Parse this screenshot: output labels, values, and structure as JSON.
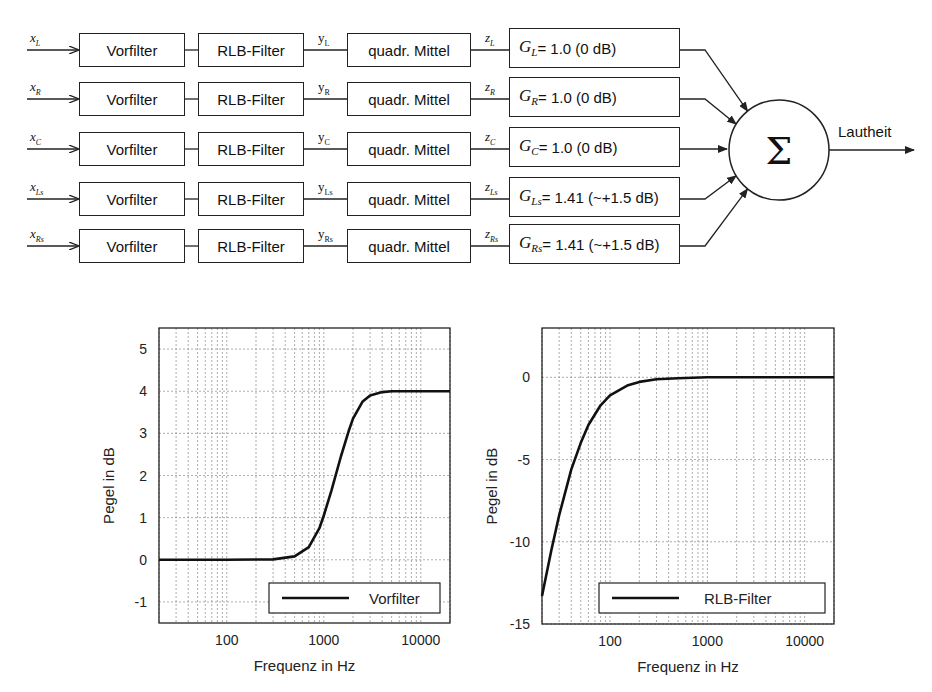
{
  "diagram": {
    "channels": [
      {
        "input": "x",
        "input_sub": "L",
        "prefilter": "Vorfilter",
        "rlb": "RLB-Filter",
        "y": "y",
        "y_sub": "L",
        "ms": "quadr. Mittel",
        "z": "z",
        "z_sub": "L",
        "gain_sym": "G",
        "gain_sub": "L",
        "gain_text": "= 1.0 (0 dB)"
      },
      {
        "input": "x",
        "input_sub": "R",
        "prefilter": "Vorfilter",
        "rlb": "RLB-Filter",
        "y": "y",
        "y_sub": "R",
        "ms": "quadr. Mittel",
        "z": "z",
        "z_sub": "R",
        "gain_sym": "G",
        "gain_sub": "R",
        "gain_text": "= 1.0 (0 dB)"
      },
      {
        "input": "x",
        "input_sub": "C",
        "prefilter": "Vorfilter",
        "rlb": "RLB-Filter",
        "y": "y",
        "y_sub": "C",
        "ms": "quadr. Mittel",
        "z": "z",
        "z_sub": "C",
        "gain_sym": "G",
        "gain_sub": "C",
        "gain_text": "= 1.0 (0 dB)"
      },
      {
        "input": "x",
        "input_sub": "Ls",
        "prefilter": "Vorfilter",
        "rlb": "RLB-Filter",
        "y": "y",
        "y_sub": "Ls",
        "ms": "quadr. Mittel",
        "z": "z",
        "z_sub": "Ls",
        "gain_sym": "G",
        "gain_sub": "Ls",
        "gain_text": "= 1.41 (~+1.5 dB)"
      },
      {
        "input": "x",
        "input_sub": "Rs",
        "prefilter": "Vorfilter",
        "rlb": "RLB-Filter",
        "y": "y",
        "y_sub": "Rs",
        "ms": "quadr. Mittel",
        "z": "z",
        "z_sub": "Rs",
        "gain_sym": "G",
        "gain_sub": "Rs",
        "gain_text": "= 1.41 (~+1.5 dB)"
      }
    ],
    "sum_symbol": "Σ",
    "output_label": "Lautheit"
  },
  "chart_data": [
    {
      "type": "line",
      "title": "",
      "xlabel": "Frequenz in Hz",
      "ylabel": "Pegel in dB",
      "xscale": "log",
      "xlim": [
        20,
        20000
      ],
      "ylim": [
        -1.5,
        5.5
      ],
      "xticks": [
        100,
        1000,
        10000
      ],
      "xtick_labels": [
        "100",
        "1000",
        "10000"
      ],
      "yticks": [
        -1,
        0,
        1,
        2,
        3,
        4,
        5
      ],
      "ytick_labels": [
        "-1",
        "0",
        "1",
        "2",
        "3",
        "4",
        "5"
      ],
      "grid": true,
      "legend_position": "lower right",
      "series": [
        {
          "name": "Vorfilter",
          "x": [
            20,
            100,
            300,
            500,
            700,
            900,
            1000,
            1200,
            1500,
            1800,
            2000,
            2500,
            3000,
            4000,
            5000,
            10000,
            20000
          ],
          "y": [
            0,
            0,
            0.01,
            0.08,
            0.3,
            0.75,
            1.05,
            1.65,
            2.45,
            3.05,
            3.35,
            3.75,
            3.9,
            3.98,
            4.0,
            4.0,
            4.0
          ]
        }
      ]
    },
    {
      "type": "line",
      "title": "",
      "xlabel": "Frequenz in Hz",
      "ylabel": "Pegel in dB",
      "xscale": "log",
      "xlim": [
        20,
        20000
      ],
      "ylim": [
        -15,
        3
      ],
      "xticks": [
        100,
        1000,
        10000
      ],
      "xtick_labels": [
        "100",
        "1000",
        "10000"
      ],
      "yticks": [
        -15,
        -10,
        -5,
        0
      ],
      "ytick_labels": [
        "-15",
        "-10",
        "-5",
        "0"
      ],
      "grid": true,
      "legend_position": "lower right",
      "series": [
        {
          "name": "RLB-Filter",
          "x": [
            20,
            25,
            30,
            40,
            50,
            60,
            80,
            100,
            150,
            200,
            300,
            500,
            1000,
            10000,
            20000
          ],
          "y": [
            -13.3,
            -10.5,
            -8.4,
            -5.6,
            -4.0,
            -2.9,
            -1.7,
            -1.1,
            -0.5,
            -0.28,
            -0.12,
            -0.05,
            0,
            0,
            0
          ]
        }
      ]
    }
  ]
}
